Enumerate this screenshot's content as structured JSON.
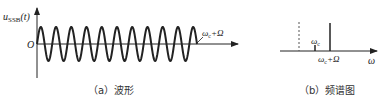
{
  "panels": [
    {
      "id": "a",
      "caption": "（a）波形",
      "y_axis_label_main": "u",
      "y_axis_label_sub": "SSB",
      "y_axis_label_arg": "(t)",
      "origin_label": "O",
      "annotation_main": "ω",
      "annotation_sub": "c",
      "annotation_rest": "+Ω",
      "cycles": 10.5
    },
    {
      "id": "b",
      "caption": "（b）频谱图",
      "x_axis_label": "ω",
      "carrier_label_main": "ω",
      "carrier_label_sub": "c",
      "line_label_main": "ω",
      "line_label_sub": "c",
      "line_label_rest": "+Ω"
    }
  ],
  "colors": {
    "stroke": "#222222",
    "dashed": "#555555"
  }
}
